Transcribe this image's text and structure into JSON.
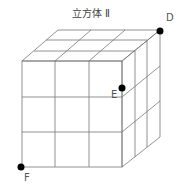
{
  "title": "立方体 Ⅱ",
  "diagram": {
    "type": "cube-3x3x3",
    "line_color": "#777777",
    "point_color": "#000000",
    "points": [
      {
        "label": "D",
        "x": 160,
        "y": 31
      },
      {
        "label": "E",
        "x": 122,
        "y": 88
      },
      {
        "label": "F",
        "x": 21,
        "y": 167
      }
    ]
  }
}
